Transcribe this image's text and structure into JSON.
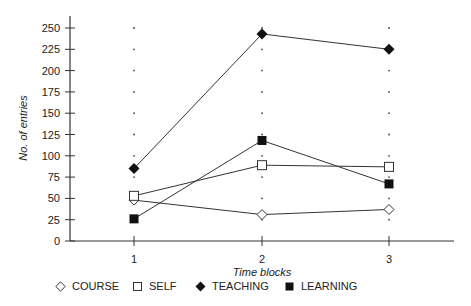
{
  "chart_data": {
    "type": "line",
    "title": "",
    "xlabel": "Time blocks",
    "ylabel": "No. of entries",
    "x": [
      1,
      2,
      3
    ],
    "categories": [
      "1",
      "2",
      "3"
    ],
    "ylim": [
      0,
      250
    ],
    "yticks": [
      0,
      25,
      50,
      75,
      100,
      125,
      150,
      175,
      200,
      225,
      250
    ],
    "grid": "dotted vertical guides at each x category",
    "legend_position": "bottom",
    "series": [
      {
        "name": "COURSE",
        "marker": "open-diamond",
        "values": [
          48,
          31,
          37
        ]
      },
      {
        "name": "SELF",
        "marker": "open-square",
        "values": [
          53,
          89,
          87
        ]
      },
      {
        "name": "TEACHING",
        "marker": "filled-diamond",
        "values": [
          85,
          243,
          225
        ]
      },
      {
        "name": "LEARNING",
        "marker": "filled-square",
        "values": [
          26,
          118,
          67
        ]
      }
    ]
  },
  "legend": {
    "items": [
      {
        "label": "COURSE",
        "icon": "open-diamond-icon"
      },
      {
        "label": "SELF",
        "icon": "open-square-icon"
      },
      {
        "label": "TEACHING",
        "icon": "filled-diamond-icon"
      },
      {
        "label": "LEARNING",
        "icon": "filled-square-icon"
      }
    ]
  },
  "colors": {
    "line": "#333333",
    "axis": "#333333",
    "marker_fill": "#111111",
    "marker_open_fill": "#ffffff"
  }
}
